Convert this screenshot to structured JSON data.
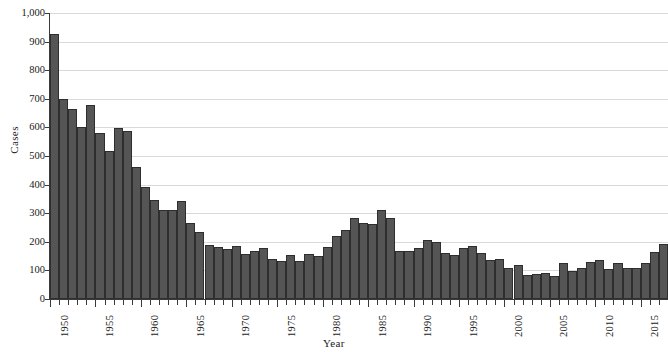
{
  "chart_data": {
    "type": "bar",
    "title": "",
    "xlabel": "Year",
    "ylabel": "Cases",
    "ylim": [
      0,
      1000
    ],
    "xlim": [
      1950,
      2017
    ],
    "grid": true,
    "legend": "none",
    "bar_color": "#555555",
    "bar_edge_color": "#2e2e2e",
    "gridline_color": "#d9d9d9",
    "axis_color": "#3a3a3a",
    "background": "#ffffff",
    "y_ticks": [
      0,
      100,
      200,
      300,
      400,
      500,
      600,
      700,
      800,
      900,
      1000
    ],
    "y_tick_labels": [
      "0",
      "100",
      "200",
      "300",
      "400",
      "500",
      "600",
      "700",
      "800",
      "900",
      "1,000"
    ],
    "x_tick_labels": [
      "1950",
      "1955",
      "1960",
      "1965",
      "1970",
      "1975",
      "1980",
      "1985",
      "1990",
      "1995",
      "2000",
      "2005",
      "2010",
      "2015"
    ],
    "x_tick_values": [
      1950,
      1955,
      1960,
      1965,
      1970,
      1975,
      1980,
      1985,
      1990,
      1995,
      2000,
      2005,
      2010,
      2015
    ],
    "categories": [
      1950,
      1951,
      1952,
      1953,
      1954,
      1955,
      1956,
      1957,
      1958,
      1959,
      1960,
      1961,
      1962,
      1963,
      1964,
      1965,
      1966,
      1967,
      1968,
      1969,
      1970,
      1971,
      1972,
      1973,
      1974,
      1975,
      1976,
      1977,
      1978,
      1979,
      1980,
      1981,
      1982,
      1983,
      1984,
      1985,
      1986,
      1987,
      1988,
      1989,
      1990,
      1991,
      1992,
      1993,
      1994,
      1995,
      1996,
      1997,
      1998,
      1999,
      2000,
      2001,
      2002,
      2003,
      2004,
      2005,
      2006,
      2007,
      2008,
      2009,
      2010,
      2011,
      2012,
      2013,
      2014,
      2015,
      2016,
      2017
    ],
    "values": [
      925,
      700,
      665,
      600,
      680,
      580,
      518,
      598,
      588,
      462,
      392,
      345,
      311,
      310,
      341,
      265,
      235,
      190,
      182,
      175,
      185,
      157,
      168,
      180,
      140,
      132,
      154,
      132,
      157,
      152,
      182,
      220,
      241,
      285,
      265,
      263,
      310,
      285,
      169,
      169,
      180,
      208,
      199,
      160,
      155,
      180,
      185,
      160,
      138,
      141,
      108,
      118,
      83,
      86,
      91,
      80,
      125,
      99,
      109,
      130,
      138,
      104,
      126,
      110,
      108,
      127,
      166,
      193
    ],
    "series": [
      {
        "name": "Cases",
        "values": [
          925,
          700,
          665,
          600,
          680,
          580,
          518,
          598,
          588,
          462,
          392,
          345,
          311,
          310,
          341,
          265,
          235,
          190,
          182,
          175,
          185,
          157,
          168,
          180,
          140,
          132,
          154,
          132,
          157,
          152,
          182,
          220,
          241,
          285,
          265,
          263,
          310,
          285,
          169,
          169,
          180,
          208,
          199,
          160,
          155,
          180,
          185,
          160,
          138,
          141,
          108,
          118,
          83,
          86,
          91,
          80,
          125,
          99,
          109,
          130,
          138,
          104,
          126,
          110,
          108,
          127,
          166,
          193
        ]
      }
    ]
  }
}
